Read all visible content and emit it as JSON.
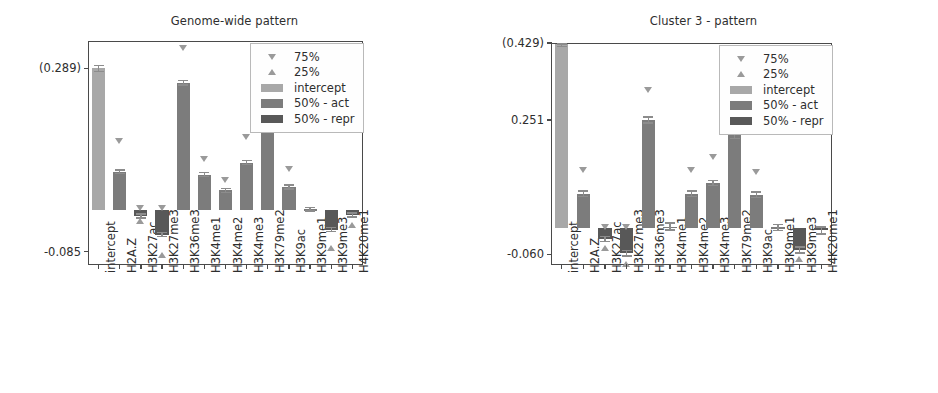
{
  "figure": {
    "width": 938,
    "height": 393,
    "background": "#ffffff"
  },
  "colors": {
    "intercept": "#a8a8a8",
    "act": "#7c7c7c",
    "repr": "#585858",
    "marker": "#9a9a9a",
    "axis": "#4a4a4a",
    "text": "#2e2e2e",
    "legend_border": "#b9b9b9"
  },
  "legend": {
    "position": "upper right",
    "rows": [
      {
        "label": "75%",
        "key": "triangle-down"
      },
      {
        "label": "25%",
        "key": "triangle-up"
      },
      {
        "label": "intercept",
        "key": "swatch",
        "color": "#a8a8a8"
      },
      {
        "label": "50% - act",
        "key": "swatch",
        "color": "#7c7c7c"
      },
      {
        "label": "50% - repr",
        "key": "swatch",
        "color": "#585858"
      }
    ]
  },
  "chart_data": [
    {
      "type": "bar",
      "panel": "left",
      "title": "Genome-wide pattern",
      "xlabel": "",
      "ylabel": "",
      "grid": false,
      "ylim": [
        -0.112,
        0.345
      ],
      "ytick_values": [
        0.289,
        -0.085
      ],
      "ytick_labels": [
        "(0.289)",
        "-0.085"
      ],
      "categories": [
        "intercept",
        "H2A.Z",
        "H3K27ac",
        "H3K27me3",
        "H3K36me3",
        "H3K4me1",
        "H3K4me2",
        "H3K4me3",
        "H3K79me2",
        "H3K9ac",
        "H3K9me1",
        "H3K9me3",
        "H4K20me1"
      ],
      "bar_kinds": [
        "intercept",
        "act",
        "repr",
        "repr",
        "act",
        "act",
        "act",
        "act",
        "act",
        "act",
        "act",
        "repr",
        "repr"
      ],
      "values": [
        0.289,
        0.078,
        -0.012,
        -0.05,
        0.26,
        0.072,
        0.04,
        0.097,
        0.188,
        0.047,
        0.002,
        -0.04,
        -0.01
      ],
      "err": [
        0.006,
        0.004,
        0.004,
        0.004,
        0.005,
        0.004,
        0.004,
        0.004,
        0.005,
        0.004,
        0.004,
        0.004,
        0.004
      ],
      "q75": [
        null,
        0.14,
        0.004,
        0.004,
        0.33,
        0.105,
        0.062,
        0.15,
        0.246,
        0.083,
        null,
        null,
        null
      ],
      "q25": [
        null,
        null,
        -0.022,
        -0.092,
        null,
        null,
        null,
        null,
        null,
        null,
        null,
        -0.078,
        -0.03
      ]
    },
    {
      "type": "bar",
      "panel": "right",
      "title": "Cluster 3 - pattern",
      "xlabel": "",
      "ylabel": "",
      "grid": false,
      "ylim": [
        -0.085,
        0.429
      ],
      "ytick_values": [
        0.429,
        0.251,
        -0.06
      ],
      "ytick_labels": [
        "(0.429)",
        "0.251",
        "-0.060"
      ],
      "categories": [
        "intercept",
        "H2A.Z",
        "H3K27ac",
        "H3K27me3",
        "H3K36me3",
        "H3K4me1",
        "H3K4me2",
        "H3K4me3",
        "H3K79me2",
        "H3K9ac",
        "H3K9me1",
        "H3K9me3",
        "H4K20me1"
      ],
      "bar_kinds": [
        "intercept",
        "act",
        "repr",
        "repr",
        "act",
        "act",
        "act",
        "act",
        "act",
        "act",
        "act",
        "repr",
        "repr"
      ],
      "values": [
        0.429,
        0.08,
        -0.025,
        -0.058,
        0.251,
        0.004,
        0.08,
        0.105,
        0.215,
        0.078,
        0.002,
        -0.05,
        -0.005
      ],
      "err": [
        0.008,
        0.006,
        0.006,
        0.006,
        0.007,
        0.008,
        0.006,
        0.006,
        0.007,
        0.006,
        0.007,
        0.007,
        0.008
      ],
      "q75": [
        null,
        0.135,
        0.004,
        0.004,
        0.32,
        null,
        0.135,
        0.165,
        0.36,
        0.13,
        null,
        null,
        null
      ],
      "q25": [
        null,
        null,
        -0.046,
        -0.082,
        null,
        null,
        null,
        null,
        null,
        null,
        null,
        -0.072,
        null
      ]
    }
  ]
}
